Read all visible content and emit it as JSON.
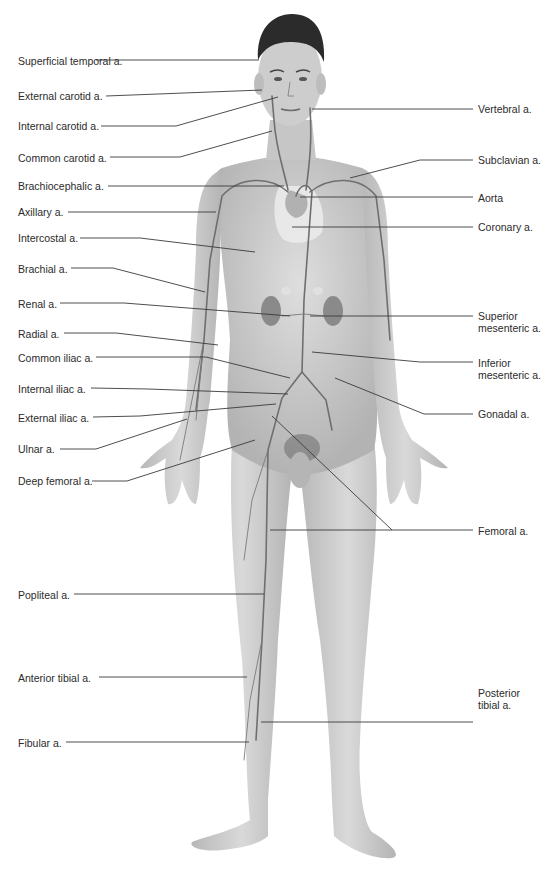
{
  "diagram": {
    "colors": {
      "background": "#ffffff",
      "skin": "#cfcfcf",
      "skin_shadow": "#a9a9a9",
      "hair": "#2b2b2b",
      "artery": "#6f6f6f",
      "kidney": "#8a8a8a",
      "lung": "#e6e6e6",
      "text": "#2b2b2b",
      "leader": "#3a3a3a"
    }
  },
  "labels_left": [
    {
      "id": "superficial-temporal",
      "text": "Superficial temporal a.",
      "x": 18,
      "y": 55,
      "line": "96,60 259,60"
    },
    {
      "id": "external-carotid",
      "text": "External carotid a.",
      "x": 18,
      "y": 90,
      "line": "106,96 262,90"
    },
    {
      "id": "internal-carotid",
      "text": "Internal carotid a.",
      "x": 18,
      "y": 120,
      "line": "101,126 176,126 278,97"
    },
    {
      "id": "common-carotid",
      "text": "Common carotid a.",
      "x": 18,
      "y": 152,
      "line": "110,157 180,157 272,131"
    },
    {
      "id": "brachiocephalic",
      "text": "Brachiocephalic a.",
      "x": 18,
      "y": 180,
      "line": "108,186 284,186"
    },
    {
      "id": "axillary",
      "text": "Axillary a.",
      "x": 18,
      "y": 206,
      "line": "68,212 216,212"
    },
    {
      "id": "intercostal",
      "text": "Intercostal a.",
      "x": 18,
      "y": 232,
      "line": "80,238 140,238 255,252"
    },
    {
      "id": "brachial",
      "text": "Brachial a.",
      "x": 18,
      "y": 263,
      "line": "71,268 113,268 205,292"
    },
    {
      "id": "renal",
      "text": "Renal a.",
      "x": 18,
      "y": 298,
      "line": "60,303 124,303 290,316"
    },
    {
      "id": "radial",
      "text": "Radial a.",
      "x": 18,
      "y": 328,
      "line": "64,333 116,333 218,345"
    },
    {
      "id": "common-iliac",
      "text": "Common iliac a.",
      "x": 18,
      "y": 352,
      "line": "96,357 206,357 290,378"
    },
    {
      "id": "internal-iliac",
      "text": "Internal iliac a.",
      "x": 18,
      "y": 383,
      "line": "91,388 148,389 288,394"
    },
    {
      "id": "external-iliac",
      "text": "External iliac a.",
      "x": 18,
      "y": 412,
      "line": "93,417 140,416 276,404"
    },
    {
      "id": "ulnar",
      "text": "Ulnar a.",
      "x": 18,
      "y": 443,
      "line": "60,449 96,449 187,419"
    },
    {
      "id": "deep-femoral",
      "text": "Deep femoral a.",
      "x": 18,
      "y": 475,
      "line": "92,481 127,481 255,440"
    },
    {
      "id": "popliteal",
      "text": "Popliteal a.",
      "x": 18,
      "y": 589,
      "line": "74,594 264,594"
    },
    {
      "id": "anterior-tibial",
      "text": "Anterior tibial a.",
      "x": 18,
      "y": 672,
      "line": "99,677 247,677"
    },
    {
      "id": "fibular",
      "text": "Fibular a.",
      "x": 18,
      "y": 737,
      "line": "66,742 249,742"
    }
  ],
  "labels_right": [
    {
      "id": "vertebral",
      "text": "Vertebral a.",
      "x": 478,
      "y": 103,
      "line": "312,109 473,109"
    },
    {
      "id": "subclavian",
      "text": "Subclavian a.",
      "x": 478,
      "y": 154,
      "line": "350,178 420,160 473,160"
    },
    {
      "id": "aorta",
      "text": "Aorta",
      "x": 478,
      "y": 192,
      "line": "300,197 473,197"
    },
    {
      "id": "coronary",
      "text": "Coronary a.",
      "x": 478,
      "y": 221,
      "line": "292,227 473,227"
    },
    {
      "id": "superior-mesenteric",
      "text": "Superior\nmesenteric a.",
      "x": 478,
      "y": 310,
      "line": "310,316 473,316"
    },
    {
      "id": "inferior-mesenteric",
      "text": "Inferior\nmesenteric a.",
      "x": 478,
      "y": 357,
      "line": "312,352 420,362 473,362"
    },
    {
      "id": "gonadal",
      "text": "Gonadal a.",
      "x": 478,
      "y": 408,
      "line": "335,378 424,414 473,414"
    },
    {
      "id": "femoral",
      "text": "Femoral a.",
      "x": 478,
      "y": 525,
      "line": "270,530 392,530 473,530",
      "extra_line": "272,416 392,530"
    },
    {
      "id": "posterior-tibial",
      "text": "Posterior\ntibial a.",
      "x": 478,
      "y": 687,
      "line": "261,722 473,722"
    }
  ]
}
